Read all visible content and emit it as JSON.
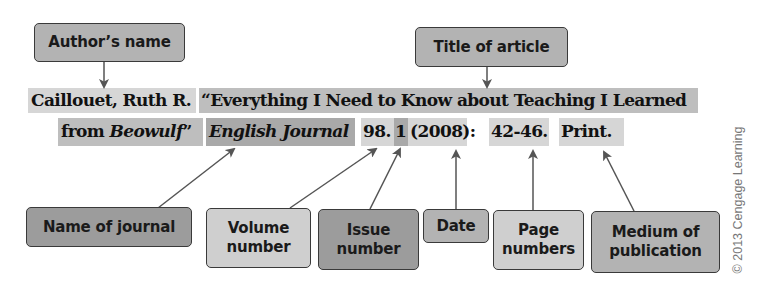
{
  "labels": {
    "author": "Author’s name",
    "title": "Title of article",
    "journal": "Name of journal",
    "volume_l1": "Volume",
    "volume_l2": "number",
    "issue_l1": "Issue",
    "issue_l2": "number",
    "date": "Date",
    "pages_l1": "Page",
    "pages_l2": "numbers",
    "medium_l1": "Medium of",
    "medium_l2": "publication"
  },
  "citation": {
    "author": "Caillouet, Ruth R.",
    "title_line1": "“Everything I Need to Know about Teaching I Learned",
    "title_line2_prefix": "from ",
    "title_line2_italic": "Beowulf",
    "title_line2_suffix": "”",
    "journal": "English Journal",
    "volume": "98.",
    "issue": "1",
    "date": "(2008):",
    "pages": "42-46.",
    "medium": "Print."
  },
  "copyright": "© 2013 Cengage Learning",
  "colors": {
    "arrow": "#555555",
    "box_border": "#3a3a3a"
  }
}
